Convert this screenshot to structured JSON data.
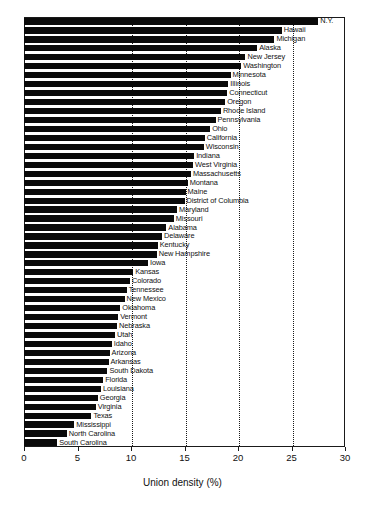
{
  "chart_data": {
    "type": "bar",
    "orientation": "horizontal",
    "title": "",
    "xlabel": "Union density (%)",
    "ylabel": "",
    "xlim": [
      0,
      30
    ],
    "xticks": [
      0,
      5,
      10,
      15,
      20,
      25,
      30
    ],
    "gridlines": {
      "x": [
        10,
        15,
        20,
        25
      ],
      "style": "dotted",
      "y": false
    },
    "bar_color": "#0a0a0a",
    "categories": [
      "N.Y.",
      "Hawaii",
      "Michigan",
      "Alaska",
      "New Jersey",
      "Washington",
      "Minnesota",
      "Illinois",
      "Connecticut",
      "Oregon",
      "Rhode Island",
      "Pennsylvania",
      "Ohio",
      "California",
      "Wisconsin",
      "Indiana",
      "West Virginia",
      "Massachusetts",
      "Montana",
      "Maine",
      "District of Columbia",
      "Maryland",
      "Missouri",
      "Alabama",
      "Delaware",
      "Kentucky",
      "New Hampshire",
      "Iowa",
      "Kansas",
      "Colorado",
      "Tennessee",
      "New Mexico",
      "Oklahoma",
      "Vermont",
      "Nebraska",
      "Utah",
      "Idaho",
      "Arizona",
      "Arkansas",
      "South Dakota",
      "Florida",
      "Louisiana",
      "Georgia",
      "Virginia",
      "Texas",
      "Mississippi",
      "North Carolina",
      "South Carolina"
    ],
    "values": [
      27.5,
      24.1,
      23.4,
      21.8,
      20.7,
      20.3,
      19.3,
      19.1,
      19.0,
      18.8,
      18.4,
      17.9,
      17.4,
      16.9,
      16.8,
      15.9,
      15.8,
      15.6,
      15.3,
      15.1,
      15.0,
      14.3,
      14.0,
      13.3,
      12.9,
      12.5,
      12.4,
      11.6,
      10.2,
      9.9,
      9.6,
      9.4,
      9.0,
      8.8,
      8.7,
      8.5,
      8.2,
      8.0,
      7.9,
      7.8,
      7.4,
      7.2,
      6.9,
      6.7,
      6.3,
      4.7,
      4.0,
      3.1
    ]
  }
}
